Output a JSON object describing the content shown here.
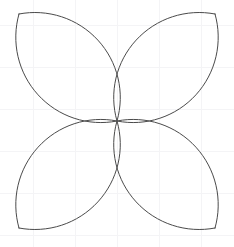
{
  "figure": {
    "background_color": "#ffffff",
    "stroke_color": "#4a4a4a",
    "stroke_width": "1",
    "fill": "none",
    "grid": {
      "visible": "true",
      "color": "#f4f4f6",
      "line_width": "1",
      "x_positions": [
        33,
        75,
        117,
        159,
        201
      ],
      "y_positions": [
        25,
        67,
        109,
        151,
        193,
        235
      ]
    },
    "geometry": {
      "box_left": 19,
      "box_top": 14,
      "box_right": 215,
      "box_bottom": 228,
      "center_x": 117,
      "center_y": 121,
      "arc_bulge": 0.56,
      "petal_count": 4
    },
    "petals": [
      {
        "name": "petal-top-left",
        "corner_x": 19,
        "corner_y": 14,
        "d": "M 19 14 C 19 78 57 118 117 121 C 53 121 22 78 19 14 Z"
      },
      {
        "name": "petal-top-right",
        "corner_x": 215,
        "corner_y": 14,
        "d": "M 215 14 C 215 78 177 118 117 121 C 181 121 212 78 215 14 Z"
      },
      {
        "name": "petal-bottom-right",
        "corner_x": 215,
        "corner_y": 228,
        "d": "M 215 228 C 215 164 177 124 117 121 C 181 121 212 164 215 228 Z"
      },
      {
        "name": "petal-bottom-left",
        "corner_x": 19,
        "corner_y": 228,
        "d": "M 19 228 C 19 164 57 124 117 121 C 53 121 22 164 19 228 Z"
      }
    ]
  }
}
